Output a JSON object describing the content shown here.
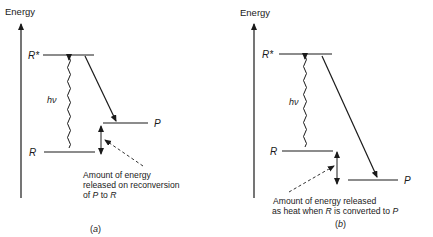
{
  "panel_a": {
    "axis_label": "Energy",
    "r_star_label": "R*",
    "r_label": "R",
    "p_label": "P",
    "photon_label": "hν",
    "annotation_line1": "Amount of energy",
    "annotation_line2": "released on reconversion",
    "annotation_line3_pre": "of ",
    "annotation_line3_p": "P",
    "annotation_line3_mid": " to ",
    "annotation_line3_r": "R",
    "caption": "(a)"
  },
  "panel_b": {
    "axis_label": "Energy",
    "r_star_label": "R*",
    "r_label": "R",
    "p_label": "P",
    "photon_label": "hν",
    "annotation_line1": "Amount of energy released",
    "annotation_line2_pre": "as heat when ",
    "annotation_line2_r": "R",
    "annotation_line2_mid": " is converted to ",
    "annotation_line2_p": "P",
    "caption": "(b)"
  },
  "colors": {
    "ink": "#1a1a1a",
    "background": "#ffffff"
  }
}
